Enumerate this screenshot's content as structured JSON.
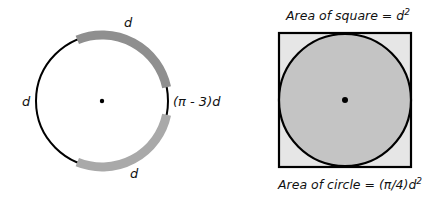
{
  "left_figure": {
    "labels": {
      "top": "d",
      "left": "d",
      "bottom": "d",
      "right": "(π - 3)d"
    },
    "colors": {
      "top_arc": "#8f8f8f",
      "bottom_arc": "#a9a9a9",
      "line": "#000000"
    }
  },
  "right_figure": {
    "top_caption": "Area of square = d",
    "top_caption_sup": "2",
    "bottom_caption": "Area of circle = (π/4)d",
    "bottom_caption_sup": "2",
    "colors": {
      "circle_fill": "#c4c4c4",
      "square_fill": "#e6e6e6",
      "line": "#000000"
    }
  }
}
